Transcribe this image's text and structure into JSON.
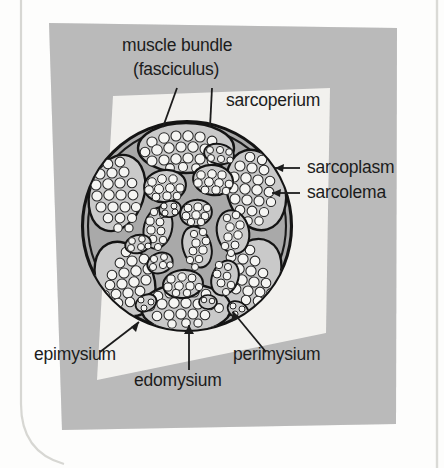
{
  "figure": {
    "title_present": false,
    "background_note": "photocopied page with grey toner patch and lighter rotated rectangle",
    "colors": {
      "page": "#fdfdfc",
      "grey_patch": "#b7b7b7",
      "light_patch": "#f2f1ec",
      "muscle_fill": "#a8a8a8",
      "fascicle_fill": "#c9c9c9",
      "cell_fill": "#f4f4f2",
      "ink": "#1c1c1c",
      "page_border": "#d4d4d0"
    }
  },
  "labels": {
    "muscle_bundle": "muscle bundle",
    "fasciculus": "(fasciculus)",
    "sarcoperium": "sarcoperium",
    "sarcoplasm": "sarcoplasm",
    "sarcolema": "sarcolema",
    "epimysium": "epimysium",
    "edomysium": "edomysium",
    "perimysium": "perimysium"
  },
  "diagram": {
    "shape": "circle",
    "center": [
      187,
      226
    ],
    "radius": 104,
    "fascicle_count": 22,
    "leaders": [
      {
        "from": "muscle_bundle",
        "to": "top-fascicle",
        "style": "plain-line"
      },
      {
        "from": "fasciculus",
        "to": "top-fascicle",
        "style": "plain-line"
      },
      {
        "from": "sarcoplasm",
        "to": "right-fascicle-cell",
        "style": "arrow"
      },
      {
        "from": "sarcolema",
        "to": "right-fascicle-cell-membrane",
        "style": "arrow"
      },
      {
        "from": "epimysium",
        "to": "outer-sheath",
        "style": "arrow"
      },
      {
        "from": "edomysium",
        "to": "bottom-fascicle-interior",
        "style": "plain-line"
      },
      {
        "from": "perimysium",
        "to": "inter-fascicle-space",
        "style": "arrow"
      }
    ]
  }
}
